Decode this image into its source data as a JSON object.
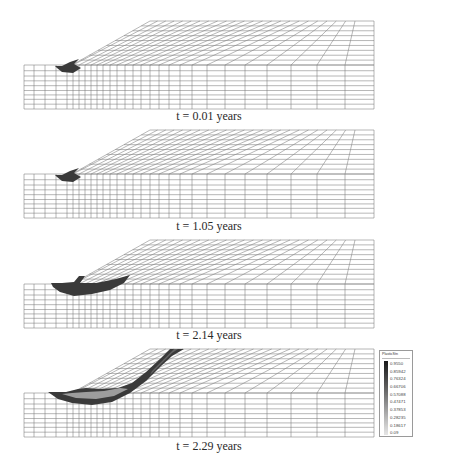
{
  "figure": {
    "panels": [
      {
        "label": "t = 0.01 years",
        "top_y": 21,
        "stage": "initial",
        "plastic_zone": "toe"
      },
      {
        "label": "t = 1.05 years",
        "top_y": 130,
        "stage": "early",
        "plastic_zone": "toe"
      },
      {
        "label": "t = 2.14 years",
        "top_y": 240,
        "stage": "developing",
        "plastic_zone": "toe-extended"
      },
      {
        "label": "t = 2.29 years",
        "top_y": 349,
        "stage": "failure",
        "plastic_zone": "full-slip-surface"
      }
    ]
  },
  "legend": {
    "title": "PlasticStn",
    "values": [
      "0.9550",
      "0.85942",
      "0.76324",
      "0.66706",
      "0.57088",
      "0.47471",
      "0.37853",
      "0.28235",
      "0.18617",
      "0.09"
    ],
    "colors": [
      "#1a1a1a",
      "#2e2e2e",
      "#444444",
      "#5a5a5a",
      "#727272",
      "#8a8a8a",
      "#a2a2a2",
      "#bababa",
      "#d0d0d0",
      "#e6e6e6"
    ]
  },
  "colors": {
    "mesh_line": "#7a7a7a",
    "plastic_dark": "#3a3a3a",
    "plastic_mid": "#6e6e6e",
    "plastic_light": "#a8a8a8"
  }
}
